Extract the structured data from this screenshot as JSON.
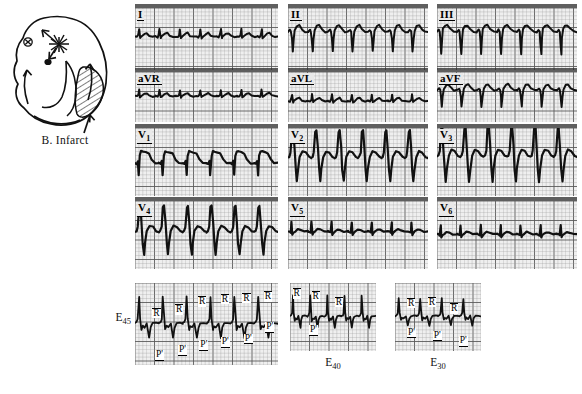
{
  "figure": {
    "paper_color": "#efefef",
    "grid_color": "#9a9a9a",
    "grid_major_color": "#5d5d5d",
    "trace_color": "#111111"
  },
  "diagram": {
    "caption": "B. Infarct",
    "icon_names": [
      "heart-outline",
      "ectopic-focus-starburst",
      "conduction-arrow",
      "infarct-hatching",
      "pointer-arrow"
    ]
  },
  "rows": [
    {
      "row_name": "limb-leads-row",
      "panels": [
        {
          "lead": "I",
          "sub": "",
          "name": "ecg-panel-lead-I"
        },
        {
          "lead": "II",
          "sub": "",
          "name": "ecg-panel-lead-II"
        },
        {
          "lead": "III",
          "sub": "",
          "name": "ecg-panel-lead-III"
        }
      ]
    },
    {
      "row_name": "augmented-leads-row",
      "panels": [
        {
          "lead": "aVR",
          "sub": "",
          "name": "ecg-panel-lead-aVR"
        },
        {
          "lead": "aVL",
          "sub": "",
          "name": "ecg-panel-lead-aVL"
        },
        {
          "lead": "aVF",
          "sub": "",
          "name": "ecg-panel-lead-aVF"
        }
      ]
    },
    {
      "row_name": "precordial-leads-row-1",
      "panels": [
        {
          "lead": "V",
          "sub": "1",
          "name": "ecg-panel-lead-V1"
        },
        {
          "lead": "V",
          "sub": "2",
          "name": "ecg-panel-lead-V2"
        },
        {
          "lead": "V",
          "sub": "3",
          "name": "ecg-panel-lead-V3"
        }
      ]
    },
    {
      "row_name": "precordial-leads-row-2",
      "panels": [
        {
          "lead": "V",
          "sub": "4",
          "name": "ecg-panel-lead-V4"
        },
        {
          "lead": "V",
          "sub": "5",
          "name": "ecg-panel-lead-V5"
        },
        {
          "lead": "V",
          "sub": "6",
          "name": "ecg-panel-lead-V6"
        }
      ]
    }
  ],
  "esophageal": {
    "row_name": "esophageal-leads-row",
    "panels": [
      {
        "label": "E",
        "sub": "45",
        "name": "ecg-panel-lead-E45",
        "label_position": "left"
      },
      {
        "label": "E",
        "sub": "40",
        "name": "ecg-panel-lead-E40",
        "label_position": "below"
      },
      {
        "label": "E",
        "sub": "30",
        "name": "ecg-panel-lead-E30",
        "label_position": "below"
      }
    ],
    "annotations": {
      "r_wave": "R",
      "p_wave": "P'"
    }
  },
  "chart_data": {
    "type": "line",
    "xlabel": "Time",
    "ylabel": "Voltage",
    "grid": true,
    "legend_position": "none",
    "paper_speed": "25 mm/s",
    "series": [
      {
        "name": "I",
        "morphology": "low-amplitude, small notched R waves, flat baseline",
        "beats": 7
      },
      {
        "name": "II",
        "morphology": "deep negative QS complexes with upright T",
        "beats": 7
      },
      {
        "name": "III",
        "morphology": "deep narrow Q waves, positive T humps",
        "beats": 7
      },
      {
        "name": "aVR",
        "morphology": "low amplitude undulating baseline",
        "beats": 7
      },
      {
        "name": "aVL",
        "morphology": "small upright R waves on flat baseline",
        "beats": 7
      },
      {
        "name": "aVF",
        "morphology": "deep QS complexes alternating with rounded T",
        "beats": 7
      },
      {
        "name": "V1",
        "morphology": "rS with deep S and elevated ST plateau",
        "beats": 6
      },
      {
        "name": "V2",
        "morphology": "tall sharp R with very deep S, large excursion",
        "beats": 6
      },
      {
        "name": "V3",
        "morphology": "tall R, very deep S, largest excursion",
        "beats": 6
      },
      {
        "name": "V4",
        "morphology": "tall peaked R with deep S, regular sawtooth",
        "beats": 6
      },
      {
        "name": "V5",
        "morphology": "small R waves, low amplitude, flat baseline",
        "beats": 7
      },
      {
        "name": "V6",
        "morphology": "small sharp R spikes on flat baseline",
        "beats": 7
      },
      {
        "name": "E45",
        "morphology": "large R waves with deep negative P' waves",
        "beats": 6
      },
      {
        "name": "E40",
        "morphology": "R waves with smaller negative P' waves",
        "beats": 5
      },
      {
        "name": "E30",
        "morphology": "R waves with shallow negative P' waves",
        "beats": 4
      }
    ]
  }
}
